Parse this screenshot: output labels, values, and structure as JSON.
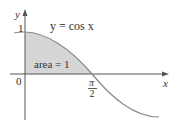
{
  "figure": {
    "curve_label": "y = cos x",
    "area_label": "area = 1",
    "y_axis_label": "y",
    "x_axis_label": "x",
    "y_tick_label": "1",
    "origin_label": "0",
    "x_tick_numerator": "π",
    "x_tick_denominator": "2",
    "colors": {
      "shade": "#d6d6d6",
      "curve": "#8a8a8a",
      "axes": "#555555",
      "text": "#333333"
    }
  }
}
